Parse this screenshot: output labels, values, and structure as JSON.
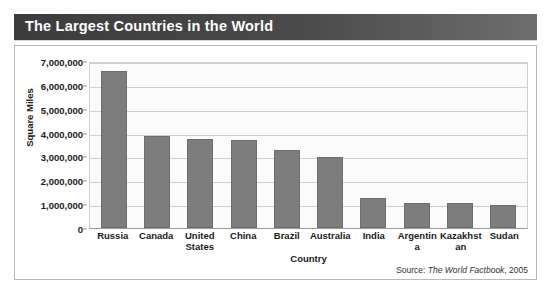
{
  "title": "The Largest Countries in the World",
  "source": {
    "prefix": "Source:",
    "work": "The World Factbook",
    "year": ", 2005"
  },
  "colors": {
    "title_bar": "#3c3c3c",
    "title_text": "#ffffff",
    "bar_fill": "#7d7d7d",
    "gridline": "#cfcfcf",
    "plot_background": "#fbfbfb",
    "panel_border": "#b9b9b9"
  },
  "chart_data": {
    "type": "bar",
    "title": "The Largest Countries in the World",
    "xlabel": "Country",
    "ylabel": "Square Miles",
    "ylim": [
      0,
      7000000
    ],
    "ytick_step": 1000000,
    "ytick_labels": [
      "7,000,000",
      "6,000,000",
      "5,000,000",
      "4,000,000",
      "3,000,000",
      "2,000,000",
      "1,000,000",
      "0"
    ],
    "yticks": [
      7000000,
      6000000,
      5000000,
      4000000,
      3000000,
      2000000,
      1000000,
      0
    ],
    "grid": true,
    "legend": null,
    "categories": [
      "Russia",
      "Canada",
      "United States",
      "China",
      "Brazil",
      "Australia",
      "India",
      "Argentina",
      "Kazakhstan",
      "Sudan"
    ],
    "values": [
      6592800,
      3855100,
      3718710,
      3705410,
      3286490,
      2967910,
      1269340,
      1068300,
      1049150,
      967500
    ]
  }
}
